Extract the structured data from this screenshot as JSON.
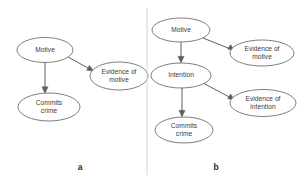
{
  "figure": {
    "panels": [
      {
        "id": "a",
        "label": "a",
        "nodes": [
          {
            "id": "a-motive",
            "label": "Motive",
            "cx": 45,
            "cy": 50,
            "rx": 28,
            "ry": 12.5
          },
          {
            "id": "a-evidence-of-motive",
            "label": "Evidence of\nmotive",
            "cx": 119,
            "cy": 76,
            "rx": 29,
            "ry": 14
          },
          {
            "id": "a-commits-crime",
            "label": "Commits\ncrime",
            "cx": 49,
            "cy": 107,
            "rx": 31,
            "ry": 14
          }
        ],
        "edges": [
          {
            "id": "a-edge-motive-to-evidence",
            "from": "Motive",
            "to": "Evidence of motive"
          },
          {
            "id": "a-edge-motive-to-crime",
            "from": "Motive",
            "to": "Commits crime"
          }
        ]
      },
      {
        "id": "b",
        "label": "b",
        "nodes": [
          {
            "id": "b-motive",
            "label": "Motive",
            "cx": 181,
            "cy": 30,
            "rx": 29,
            "ry": 12
          },
          {
            "id": "b-evidence-of-motive",
            "label": "Evidence of\nmotive",
            "cx": 262,
            "cy": 53,
            "rx": 32,
            "ry": 13
          },
          {
            "id": "b-intention",
            "label": "Intention",
            "cx": 181,
            "cy": 75.5,
            "rx": 30,
            "ry": 12.5
          },
          {
            "id": "b-evidence-of-intention",
            "label": "Evidence of\nintention",
            "cx": 263,
            "cy": 103,
            "rx": 33,
            "ry": 13.5
          },
          {
            "id": "b-commits-crime",
            "label": "Commits\ncrime",
            "cx": 184,
            "cy": 130,
            "rx": 29,
            "ry": 13
          }
        ],
        "edges": [
          {
            "id": "b-edge-motive-to-evidence",
            "from": "Motive",
            "to": "Evidence of motive"
          },
          {
            "id": "b-edge-motive-to-intention",
            "from": "Motive",
            "to": "Intention"
          },
          {
            "id": "b-edge-intention-to-evidence",
            "from": "Intention",
            "to": "Evidence of intention"
          },
          {
            "id": "b-edge-intention-to-crime",
            "from": "Intention",
            "to": "Commits crime"
          }
        ]
      }
    ],
    "divider": {
      "x": 147,
      "y1": 8,
      "y2": 175
    },
    "colors": {
      "node_stroke": "#6f6f6f",
      "edge_stroke": "#5e5e5e",
      "divider": "#d8d8d8",
      "text": "#3b3b3b",
      "background": "#ffffff"
    }
  }
}
